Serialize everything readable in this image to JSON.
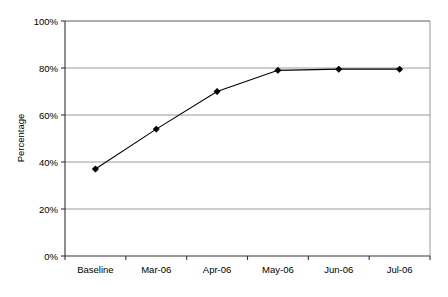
{
  "chart_data": {
    "type": "line",
    "title": "",
    "subtitle": "",
    "xlabel": "",
    "ylabel": "Percentage",
    "categories": [
      "Baseline",
      "Mar-06",
      "Apr-06",
      "May-06",
      "Jun-06",
      "Jul-06"
    ],
    "values": [
      37,
      54,
      70,
      79,
      79.5,
      79.5
    ],
    "series": [
      {
        "name": "Percentage",
        "values": [
          37,
          54,
          70,
          79,
          79.5,
          79.5
        ],
        "color": "#000000",
        "marker": "diamond"
      }
    ],
    "ylim": [
      0,
      100
    ],
    "ytick_values": [
      0,
      20,
      40,
      60,
      80,
      100
    ],
    "ytick_labels": [
      "0%",
      "20%",
      "40%",
      "60%",
      "80%",
      "100%"
    ],
    "xtick_labels": [
      "Baseline",
      "Mar-06",
      "Apr-06",
      "May-06",
      "Jun-06",
      "Jul-06"
    ],
    "grid": true,
    "grid_axis": "y",
    "legend": false,
    "legend_position": "none",
    "background": "#ffffff",
    "gridline_color": "#808080",
    "axis_color": "#333333"
  },
  "axis": {
    "y_title": "Percentage",
    "y_labels": [
      "100%",
      "80%",
      "60%",
      "40%",
      "20%",
      "0%"
    ],
    "x_labels": [
      "Baseline",
      "Mar-06",
      "Apr-06",
      "May-06",
      "Jun-06",
      "Jul-06"
    ]
  }
}
